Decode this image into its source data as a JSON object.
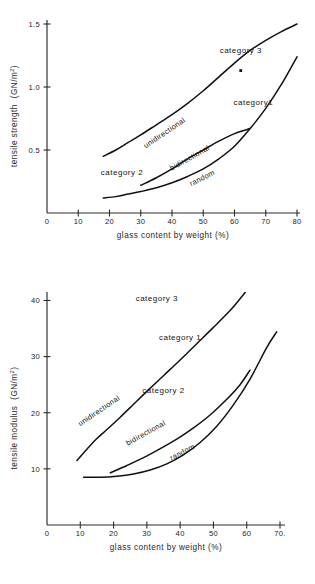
{
  "chart_data": [
    {
      "type": "line",
      "id": "tensile-strength",
      "title": "",
      "xlabel": "glass content by weight (%)",
      "ylabel": "tensile strength  (GN/m²)",
      "ylabel_main": "tensile strength",
      "ylabel_unit_open": "(GN/m",
      "ylabel_unit_sup": "2",
      "ylabel_unit_close": ")",
      "xlim": [
        0,
        80
      ],
      "ylim": [
        0,
        1.5
      ],
      "xticks": [
        0,
        10,
        20,
        30,
        40,
        50,
        60,
        70,
        80
      ],
      "xtick_labels": [
        "0",
        "10",
        "20",
        "30",
        "40",
        "50",
        "60",
        "70",
        "80"
      ],
      "yticks": [
        0.5,
        1.0,
        1.5
      ],
      "ytick_labels": [
        "0.5",
        "1.0",
        "1.5"
      ],
      "grid": false,
      "legend_position": "inline-annotations",
      "series": [
        {
          "name": "unidirectional",
          "label": "unidirectional",
          "category_label": "category 3",
          "points": [
            [
              18,
              0.45
            ],
            [
              22,
              0.5
            ],
            [
              26,
              0.56
            ],
            [
              30,
              0.62
            ],
            [
              35,
              0.7
            ],
            [
              40,
              0.78
            ],
            [
              45,
              0.87
            ],
            [
              50,
              0.97
            ],
            [
              55,
              1.08
            ],
            [
              60,
              1.19
            ],
            [
              65,
              1.29
            ],
            [
              70,
              1.37
            ],
            [
              75,
              1.44
            ],
            [
              80,
              1.5
            ]
          ]
        },
        {
          "name": "bidirectional",
          "label": "bidirectional",
          "category_label": "category 2",
          "points": [
            [
              30,
              0.22
            ],
            [
              35,
              0.28
            ],
            [
              40,
              0.35
            ],
            [
              45,
              0.43
            ],
            [
              50,
              0.5
            ],
            [
              55,
              0.57
            ],
            [
              60,
              0.63
            ],
            [
              65,
              0.67
            ]
          ]
        },
        {
          "name": "random",
          "label": "random",
          "category_label": "category 1",
          "points": [
            [
              18,
              0.12
            ],
            [
              22,
              0.13
            ],
            [
              26,
              0.15
            ],
            [
              30,
              0.17
            ],
            [
              35,
              0.2
            ],
            [
              40,
              0.24
            ],
            [
              45,
              0.29
            ],
            [
              50,
              0.35
            ],
            [
              55,
              0.43
            ],
            [
              60,
              0.53
            ],
            [
              65,
              0.67
            ],
            [
              70,
              0.83
            ],
            [
              75,
              1.02
            ],
            [
              80,
              1.24
            ]
          ]
        }
      ],
      "annotations": [
        {
          "name": "category-3",
          "text": "category 3",
          "x": 62,
          "y": 1.27
        },
        {
          "name": "category-1",
          "text": "category1",
          "x": 66,
          "y": 0.86
        },
        {
          "name": "category-2",
          "text": "category 2",
          "x": 24,
          "y": 0.3
        },
        {
          "name": "unidirectional",
          "text": "unidirectional",
          "x": 38,
          "y": 0.62
        },
        {
          "name": "bidirectional",
          "text": "bidirectional",
          "x": 46,
          "y": 0.42
        },
        {
          "name": "random",
          "text": "random",
          "x": 50,
          "y": 0.26
        }
      ],
      "markers": [
        {
          "name": "category-3-data-point",
          "x": 62,
          "y": 1.13
        }
      ]
    },
    {
      "type": "line",
      "id": "tensile-modulus",
      "title": "",
      "xlabel": "glass content by weight (%)",
      "ylabel": "tensile modulus  (GN/m²)",
      "ylabel_main": "tensile modulus",
      "ylabel_unit_open": "(GN/m",
      "ylabel_unit_sup": "2",
      "ylabel_unit_close": ")",
      "xlim": [
        0,
        70
      ],
      "ylim": [
        0,
        44
      ],
      "xticks": [
        0,
        10,
        20,
        30,
        40,
        50,
        60,
        70
      ],
      "xtick_labels": [
        "0",
        "10",
        "20",
        "30",
        "40",
        "50",
        "60",
        "70."
      ],
      "yticks": [
        10,
        20,
        30,
        40
      ],
      "ytick_labels": [
        "10",
        "20",
        "30",
        "40"
      ],
      "grid": false,
      "legend_position": "inline-annotations",
      "series": [
        {
          "name": "unidirectional",
          "label": "unidirectional",
          "category_label": "category 3",
          "points": [
            [
              9,
              11.5
            ],
            [
              12,
              13.5
            ],
            [
              15,
              15.4
            ],
            [
              18,
              17.0
            ],
            [
              22,
              19.2
            ],
            [
              26,
              21.5
            ],
            [
              30,
              23.8
            ],
            [
              35,
              26.6
            ],
            [
              40,
              29.4
            ],
            [
              45,
              32.3
            ],
            [
              50,
              35.2
            ],
            [
              55,
              38.2
            ],
            [
              58,
              40.3
            ],
            [
              60,
              41.8
            ]
          ]
        },
        {
          "name": "bidirectional",
          "label": "bidirectional",
          "category_label": "category 2",
          "points": [
            [
              19,
              9.3
            ],
            [
              24,
              10.6
            ],
            [
              29,
              12.0
            ],
            [
              34,
              13.6
            ],
            [
              39,
              15.3
            ],
            [
              44,
              17.3
            ],
            [
              49,
              19.6
            ],
            [
              54,
              22.4
            ],
            [
              58,
              25.0
            ],
            [
              61,
              27.6
            ]
          ]
        },
        {
          "name": "random",
          "label": "random",
          "category_label": "category 1",
          "points": [
            [
              11,
              8.5
            ],
            [
              16,
              8.5
            ],
            [
              21,
              8.7
            ],
            [
              26,
              9.1
            ],
            [
              31,
              9.8
            ],
            [
              36,
              10.9
            ],
            [
              41,
              12.5
            ],
            [
              46,
              14.7
            ],
            [
              51,
              17.6
            ],
            [
              56,
              21.4
            ],
            [
              61,
              26.0
            ],
            [
              66,
              31.6
            ],
            [
              69,
              34.4
            ]
          ]
        }
      ],
      "annotations": [
        {
          "name": "category-3",
          "text": "category 3",
          "x": 33,
          "y": 40.0
        },
        {
          "name": "category-1",
          "text": "category 1",
          "x": 40,
          "y": 33.0
        },
        {
          "name": "category-2",
          "text": "category 2",
          "x": 35,
          "y": 23.5
        },
        {
          "name": "unidirectional",
          "text": "unidirectional",
          "x": 16,
          "y": 20.0
        },
        {
          "name": "bidirectional",
          "text": "bidirectional",
          "x": 30,
          "y": 16.0
        },
        {
          "name": "random",
          "text": "random",
          "x": 41,
          "y": 12.6
        }
      ],
      "markers": []
    }
  ]
}
